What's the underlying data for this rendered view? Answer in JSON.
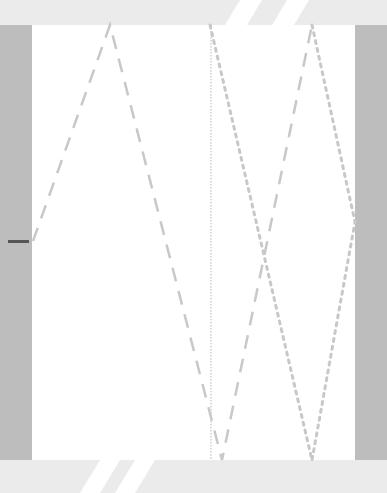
{
  "scene": {
    "colors": {
      "side_bars": "#bdbdbd",
      "top_bottom_bars": "#ebebeb",
      "field": "#ffffff",
      "lines": "#c8c8c8",
      "marker": "#555555"
    },
    "paddle_marker": {
      "x": 8,
      "y": 240,
      "width": 21
    }
  }
}
